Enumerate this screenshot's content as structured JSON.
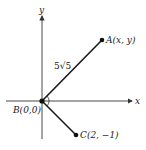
{
  "axes": {
    "x_label": "x",
    "y_label": "y"
  },
  "points": {
    "A": {
      "label": "A(x, y)"
    },
    "B": {
      "label": "B(0,0)"
    },
    "C": {
      "label": "C(2, −1)"
    }
  },
  "segment_label": "5√5",
  "colors": {
    "line": "#1a1a1a",
    "axis": "#333333"
  }
}
